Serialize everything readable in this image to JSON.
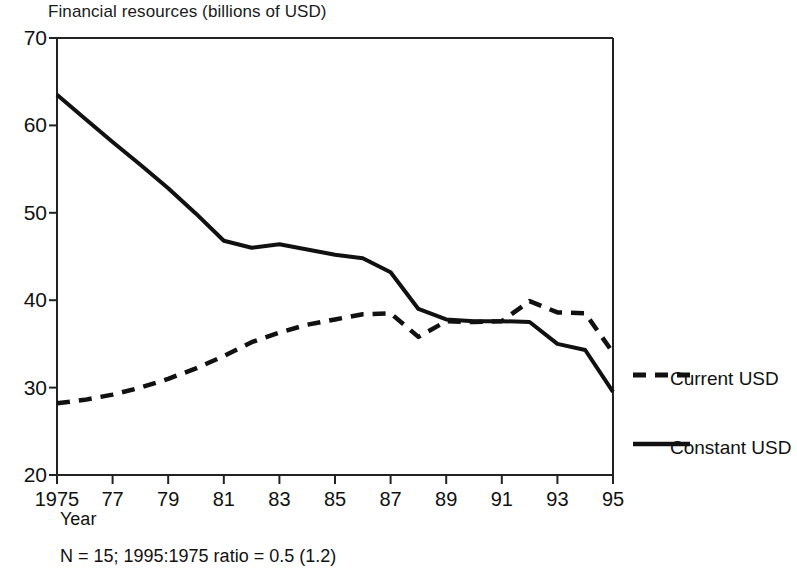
{
  "chart_data": {
    "type": "line",
    "title": "Financial resources (billions of USD)",
    "xlabel": "Year",
    "ylabel": "",
    "footnote": "N = 15; 1995:1975 ratio = 0.5 (1.2)",
    "grid": false,
    "legend_position": "right",
    "xlim": [
      1975,
      1995
    ],
    "ylim": [
      20,
      70
    ],
    "ytick_labels": [
      "70",
      "60",
      "50",
      "40",
      "30",
      "20"
    ],
    "ytick_values": [
      70,
      60,
      50,
      40,
      30,
      20
    ],
    "xtick_labels": [
      "1975",
      "77",
      "79",
      "81",
      "83",
      "85",
      "87",
      "89",
      "91",
      "93",
      "95"
    ],
    "xtick_values": [
      1975,
      1977,
      1979,
      1981,
      1983,
      1985,
      1987,
      1989,
      1991,
      1993,
      1995
    ],
    "x": [
      1975,
      1976,
      1977,
      1978,
      1979,
      1980,
      1981,
      1982,
      1983,
      1984,
      1985,
      1986,
      1987,
      1988,
      1989,
      1990,
      1991,
      1992,
      1993,
      1994,
      1995
    ],
    "series": [
      {
        "name": "Current USD",
        "style": "dashed",
        "color": "#111111",
        "values": [
          28.2,
          28.6,
          29.2,
          30.0,
          31.0,
          32.2,
          33.6,
          35.2,
          36.3,
          37.2,
          37.8,
          38.4,
          38.5,
          35.8,
          37.6,
          37.5,
          37.6,
          39.9,
          38.6,
          38.5,
          34.0
        ]
      },
      {
        "name": "Constant USD",
        "style": "solid",
        "color": "#111111",
        "values": [
          63.5,
          60.8,
          58.1,
          55.5,
          52.8,
          49.9,
          46.8,
          46.0,
          46.4,
          45.8,
          45.2,
          44.8,
          43.2,
          39.0,
          37.8,
          37.6,
          37.6,
          37.5,
          35.0,
          34.3,
          29.5
        ]
      }
    ]
  },
  "legend": {
    "items": [
      {
        "label": "Current USD",
        "style": "dashed"
      },
      {
        "label": "Constant USD",
        "style": "solid"
      }
    ]
  }
}
